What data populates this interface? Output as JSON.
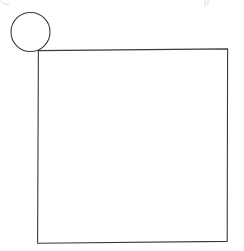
{
  "canvas": {
    "width": 244,
    "height": 251,
    "background_color": "#ffffff",
    "stroke_color": "#3a3a3a",
    "artifact_color": "#d8d8d8",
    "description": "Hand-drawn line sketch: an unfilled circle overlapping the top-left corner of a large unfilled square"
  },
  "shapes": {
    "circle": {
      "name": "circle",
      "center_x": 30.5,
      "center_y": 32,
      "radius": 19.5,
      "bounds": {
        "left": 11,
        "top": 12,
        "right": 50,
        "bottom": 52
      },
      "fill": "none",
      "stroke": "#3a3a3a",
      "stroke_width": 1.1,
      "path": "M 30.5 12.5 C 41.3 12.5 50 21.2 50 32 C 50 42.8 41.3 51.5 30.5 51.5 C 19.7 51.5 11 42.8 11 32 C 11 21.2 19.7 12.5 30.5 12.5 Z"
    },
    "square": {
      "name": "square",
      "left": 38,
      "top": 49.5,
      "right": 227.5,
      "bottom": 241.5,
      "width": 189.5,
      "height": 192,
      "fill": "none",
      "stroke": "#3a3a3a",
      "stroke_width": 1.1,
      "path": "M 38.4 50.6 L 227.6 48.9 L 227.2 241.4 L 37.6 243.2 L 38.4 50.6 Z"
    }
  },
  "artifacts": [
    {
      "name": "top-left-scan-artifact",
      "path": "M 1 1 C 3 4 6 5 9 4",
      "stroke": "#d8d8d8"
    },
    {
      "name": "top-right-scan-artifact",
      "path": "M 205 0 L 205 6 M 208 0 L 208 5",
      "stroke": "#d8d8d8"
    }
  ]
}
